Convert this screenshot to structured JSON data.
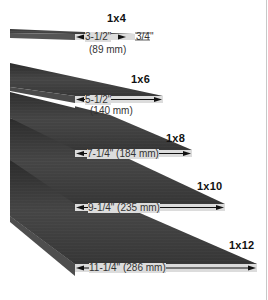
{
  "diagram": {
    "colors": {
      "board_face": "#3a3a3a",
      "board_face_light": "#5a5a5a",
      "end_strip": "#d9d9d9",
      "arrow": "#111111",
      "text": "#333333",
      "label": "#111111"
    },
    "boards": [
      {
        "nominal": "1x4",
        "width_in": "3-1/2\"",
        "width_mm": "(89 mm)",
        "thickness": "3/4\""
      },
      {
        "nominal": "1x6",
        "width_in": "5-1/2\"",
        "width_mm": "(140 mm)"
      },
      {
        "nominal": "1x8",
        "width_label": "7-1/4\" (184 mm)"
      },
      {
        "nominal": "1x10",
        "width_label": "9-1/4\" (235 mm)"
      },
      {
        "nominal": "1x12",
        "width_label": "11-1/4\" (286 mm)"
      }
    ]
  }
}
